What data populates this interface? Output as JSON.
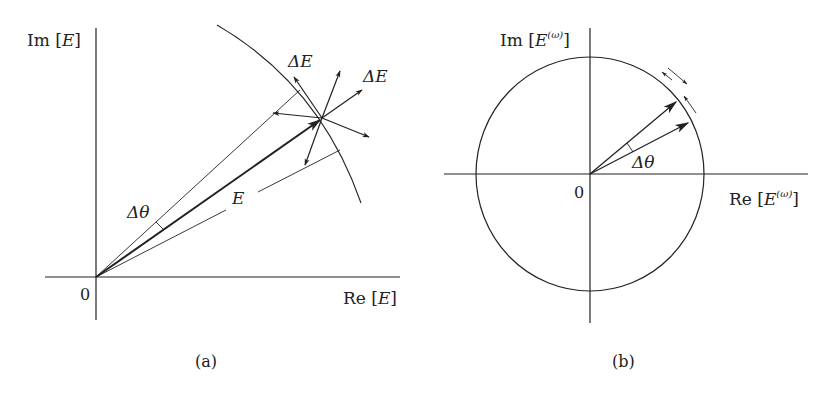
{
  "panels": [
    {
      "id": "a",
      "caption": "(a)",
      "axes": {
        "x_label": "Re [E]",
        "x_label_parts": {
          "prefix": "Re [",
          "var": "E",
          "suffix": "]"
        },
        "y_label": "Im [E]",
        "y_label_parts": {
          "prefix": "Im [",
          "var": "E",
          "suffix": "]"
        },
        "origin_label": "0"
      },
      "vectors": {
        "main_label": "E",
        "delta_labels": [
          "ΔE",
          "ΔE"
        ],
        "angle_label": "Δθ",
        "delta_label_prefix": "Δ",
        "delta_label_var": "E",
        "angle_label_var": "θ"
      }
    },
    {
      "id": "b",
      "caption": "(b)",
      "axes": {
        "x_label": "Re [E^(ω)]",
        "x_label_parts": {
          "prefix": "Re [",
          "var": "E",
          "sup": "(ω)",
          "suffix": "]"
        },
        "y_label": "Im [E^(ω)]",
        "y_label_parts": {
          "prefix": "Im [",
          "var": "E",
          "sup": "(ω)",
          "suffix": "]"
        },
        "origin_label": "0"
      },
      "vectors": {
        "angle_label": "Δθ",
        "angle_label_prefix": "Δ",
        "angle_label_var": "θ"
      }
    }
  ],
  "colors": {
    "line": "#222222",
    "background": "#ffffff"
  }
}
